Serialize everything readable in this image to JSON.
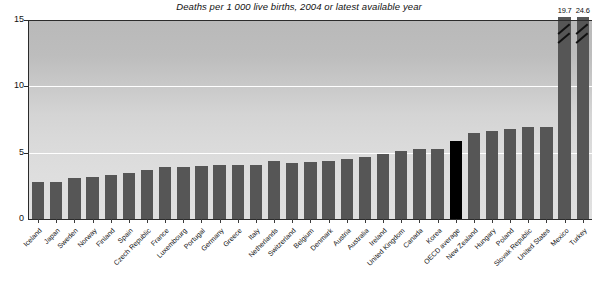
{
  "chart_data": {
    "type": "bar",
    "title": "Deaths per 1 000 live births, 2004 or latest available year",
    "xlabel": "",
    "ylabel": "",
    "ylim": [
      0,
      15
    ],
    "yticks": [
      0,
      5,
      10,
      15
    ],
    "grid": true,
    "legend": null,
    "categories": [
      "Iceland",
      "Japan",
      "Sweden",
      "Norway",
      "Finland",
      "Spain",
      "Czech Republic",
      "France",
      "Luxembourg",
      "Portugal",
      "Germany",
      "Greece",
      "Italy",
      "Netherlands",
      "Switzerland",
      "Belgium",
      "Denmark",
      "Austria",
      "Australia",
      "Ireland",
      "United Kingdom",
      "Canada",
      "Korea",
      "OECD average",
      "New Zealand",
      "Hungary",
      "Poland",
      "Slovak Republic",
      "United States",
      "Mexico",
      "Turkey"
    ],
    "values": [
      2.8,
      2.8,
      3.1,
      3.2,
      3.3,
      3.5,
      3.7,
      3.9,
      3.9,
      4.0,
      4.1,
      4.1,
      4.1,
      4.4,
      4.2,
      4.3,
      4.4,
      4.5,
      4.7,
      4.9,
      5.1,
      5.3,
      5.3,
      5.9,
      6.5,
      6.6,
      6.8,
      6.9,
      6.9,
      19.7,
      24.6
    ],
    "annotations": [
      {
        "category": "Mexico",
        "label": "19.7"
      },
      {
        "category": "Turkey",
        "label": "24.6"
      }
    ],
    "highlight_category": "OECD average",
    "clipped_categories": [
      "Mexico",
      "Turkey"
    ],
    "colors": {
      "bar": "#565656",
      "highlight_bar": "#000000",
      "plot_background": "#d3d3d3",
      "gridline": "#ffffff",
      "axis": "#2b2b2b",
      "text": "#111111"
    }
  }
}
